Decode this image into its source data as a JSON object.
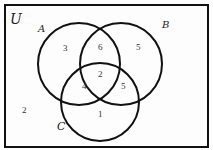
{
  "diagram": {
    "type": "venn",
    "universe_label": "U",
    "sets": [
      {
        "name": "A",
        "cx": 79,
        "cy": 64,
        "r": 41
      },
      {
        "name": "B",
        "cx": 121,
        "cy": 64,
        "r": 41
      },
      {
        "name": "C",
        "cx": 100,
        "cy": 102,
        "r": 39
      }
    ],
    "regions": {
      "A_only": "3",
      "B_only": "5",
      "C_only": "1",
      "A_and_B_only": "6",
      "A_and_C_only": "4",
      "B_and_C_only": "5",
      "A_and_B_and_C": "2",
      "outside": "2"
    },
    "colors": {
      "stroke": "#111111",
      "background": "#fdfdfd"
    }
  }
}
